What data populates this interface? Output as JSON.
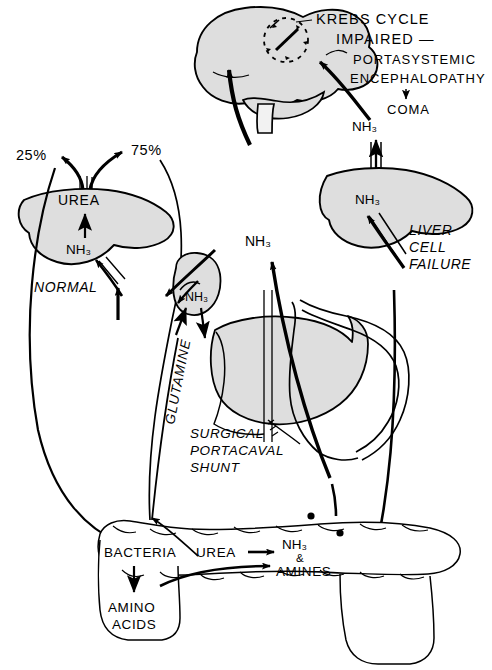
{
  "figure": {
    "canvas": {
      "width": 492,
      "height": 670
    },
    "palette": {
      "background": "#ffffff",
      "organ_fill": "#dedede",
      "organ_fill_dark": "#d2d2d2",
      "stroke": "#000000",
      "text": "#000000"
    }
  },
  "labels": {
    "krebs_line1": "KREBS CYCLE",
    "krebs_line2": "IMPAIRED —",
    "portasystemic": "PORTASYSTEMIC",
    "encephalopathy": "ENCEPHALOPATHY",
    "coma": "COMA",
    "nh3_brain_right": "NH₃",
    "nh3_liver_out": "NH₃",
    "nh3_liver_in": "NH₃",
    "liver_cell_failure_1": "LIVER",
    "liver_cell_failure_2": "CELL",
    "liver_cell_failure_3": "FAILURE",
    "nh3_shunt": "NH₃",
    "surgical_1": "SURGICAL",
    "surgical_2": "PORTACAVAL",
    "surgical_3": "SHUNT",
    "pct_25": "25%",
    "pct_75": "75%",
    "urea_liver": "UREA",
    "nh3_normal_liver": "NH₃",
    "normal": "NORMAL",
    "nh3_kidney": "NH₃",
    "glutamine": "GLUTAMINE",
    "bacteria": "BACTERIA",
    "urea_gut": "UREA",
    "amino_1": "AMINO",
    "amino_2": "ACIDS",
    "nh3_gut": "NH₃",
    "ampersand": "&",
    "amines": "AMINES"
  },
  "organs": [
    {
      "name": "brain",
      "label": "Brain (cerebrum, cerebellum, brainstem)"
    },
    {
      "name": "liver-normal",
      "label": "Normal liver"
    },
    {
      "name": "liver-failing",
      "label": "Failing liver"
    },
    {
      "name": "liver-shunted",
      "label": "Shunted liver with portal vasculature"
    },
    {
      "name": "kidney",
      "label": "Kidney"
    },
    {
      "name": "intestine",
      "label": "Intestine / gut"
    }
  ],
  "pathways": [
    {
      "name": "normal-urea",
      "from": "NH₃",
      "to": "UREA",
      "site": "liver"
    },
    {
      "name": "urea-renal",
      "from": "UREA",
      "to": "25%",
      "site": "excretion"
    },
    {
      "name": "urea-gut",
      "from": "UREA",
      "to": "75%",
      "site": "gut"
    },
    {
      "name": "glutamine-kidney",
      "from": "GLUTAMINE",
      "to": "NH₃",
      "site": "kidney"
    },
    {
      "name": "portacaval-shunt",
      "from": "NH₃",
      "to": "brain",
      "site": "shunt"
    },
    {
      "name": "liver-failure",
      "from": "NH₃",
      "to": "brain",
      "site": "failing liver"
    },
    {
      "name": "bacterial-urease",
      "from": "BACTERIA",
      "to": "NH₃ & AMINES",
      "site": "gut"
    }
  ]
}
